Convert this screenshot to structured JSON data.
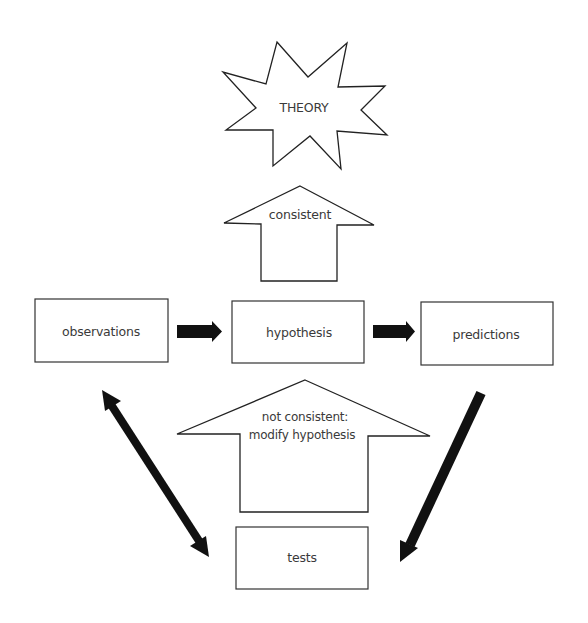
{
  "diagram": {
    "colors": {
      "background": "#ffffff",
      "stroke": "#222222",
      "arrow_fill": "#111111",
      "text": "#3a3a3a"
    },
    "nodes": {
      "theory": {
        "label": "THEORY",
        "shape": "starburst"
      },
      "observations": {
        "label": "observations",
        "shape": "rectangle"
      },
      "hypothesis": {
        "label": "hypothesis",
        "shape": "rectangle"
      },
      "predictions": {
        "label": "predictions",
        "shape": "rectangle"
      },
      "tests": {
        "label": "tests",
        "shape": "rectangle"
      }
    },
    "block_arrows": {
      "consistent": {
        "label": "consistent",
        "from": "hypothesis",
        "to": "theory"
      },
      "not_consistent": {
        "line1": "not consistent:",
        "line2": "modify hypothesis",
        "from": "tests",
        "to": "hypothesis"
      }
    },
    "edges": [
      {
        "from": "observations",
        "to": "hypothesis",
        "style": "thick-arrow"
      },
      {
        "from": "hypothesis",
        "to": "predictions",
        "style": "thick-arrow"
      },
      {
        "from": "predictions",
        "to": "tests",
        "style": "thick-diagonal-arrow"
      },
      {
        "from": "tests",
        "to": "observations",
        "style": "double-headed-diagonal-arrow"
      }
    ]
  }
}
